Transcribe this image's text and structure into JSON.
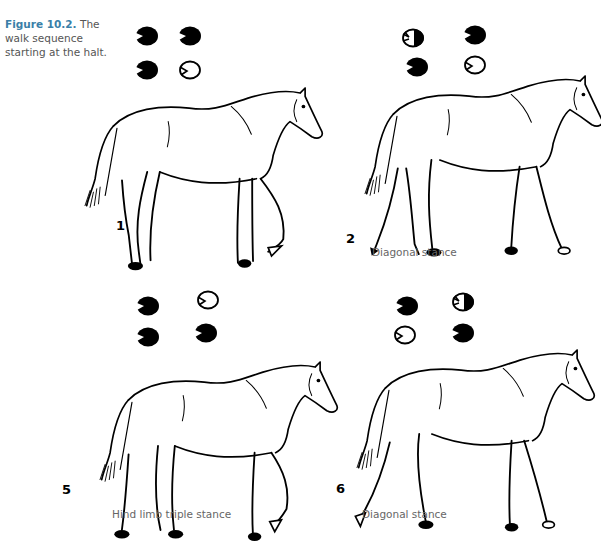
{
  "figure": {
    "label": "Figure 10.2.",
    "caption": " The walk sequence starting at the halt."
  },
  "legend_note": "Black filled hoof = weight-bearing; outline hoof = in flight; half-filled = landing/lifting",
  "panels": [
    {
      "number": "1",
      "stance_label": "",
      "hooves": {
        "top_left": "filled",
        "top_right": "filled",
        "bottom_left": "filled",
        "bottom_right": "outline"
      }
    },
    {
      "number": "2",
      "stance_label": "Diagonal stance",
      "hooves": {
        "top_left": "half",
        "top_right": "filled",
        "bottom_left": "filled",
        "bottom_right": "outline"
      }
    },
    {
      "number": "5",
      "stance_label": "Hind limb triple stance",
      "hooves": {
        "top_left": "filled",
        "top_right": "outline",
        "bottom_left": "filled",
        "bottom_right": "filled"
      }
    },
    {
      "number": "6",
      "stance_label": "Diagonal stance",
      "hooves": {
        "top_left": "filled",
        "top_right": "half",
        "bottom_left": "outline",
        "bottom_right": "filled"
      }
    }
  ]
}
